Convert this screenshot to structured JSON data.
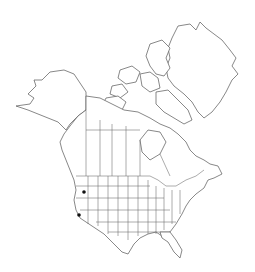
{
  "map": {
    "region": "North America",
    "style": "outline map with state and province boundaries",
    "colors": {
      "background": "#ffffff",
      "outline": "#555555",
      "marker": "#111111"
    },
    "occurrences": [
      {
        "label": "Oregon",
        "x": 84,
        "y": 192
      },
      {
        "label": "California",
        "x": 79,
        "y": 215
      }
    ]
  }
}
